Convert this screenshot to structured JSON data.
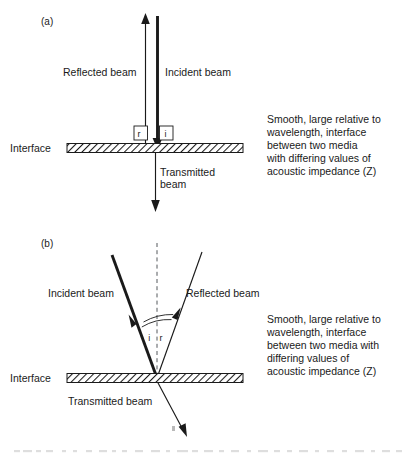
{
  "figure": {
    "panels": [
      {
        "id": "a",
        "label": "(a)",
        "interface_label": "Interface",
        "incident_label": "Incident beam",
        "reflected_label": "Reflected beam",
        "transmitted_label_line1": "Transmitted",
        "transmitted_label_line2": "beam",
        "angle_incident": "i",
        "angle_reflected": "r",
        "note_lines": [
          "Smooth, large relative to",
          "wavelength, interface",
          "between two media",
          "with differing values of",
          "acoustic impedance  (Z)"
        ]
      },
      {
        "id": "b",
        "label": "(b)",
        "interface_label": "Interface",
        "incident_label": "Incident beam",
        "reflected_label": "Reflected beam",
        "transmitted_label": "Transmitted beam",
        "angle_incident": "i",
        "angle_reflected": "r",
        "note_lines": [
          "Smooth, large relative to",
          "wavelength, interface",
          "between two media with",
          "differing values of",
          "acoustic impedance (Z)"
        ]
      }
    ],
    "colors": {
      "ink": "#1a1a1a",
      "normal_dash": "#55595c",
      "hatch_fill": "#ffffff",
      "page": "#ffffff",
      "cut_caption": "#c9c9c9"
    },
    "cut_caption": "partially cropped caption line at page bottom"
  }
}
